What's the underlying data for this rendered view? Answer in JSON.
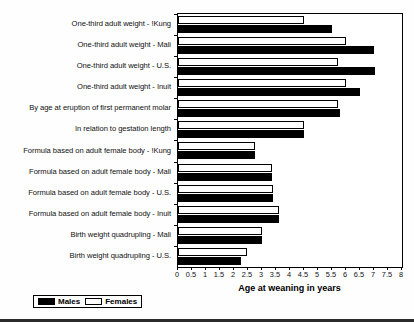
{
  "chart_data": {
    "type": "bar",
    "orientation": "horizontal",
    "title": "",
    "xlabel": "Age at weaning in years",
    "ylabel": "",
    "xlim": [
      0,
      8
    ],
    "xticks": [
      "0",
      "0.5",
      "1",
      "1.5",
      "2",
      "2.5",
      "3",
      "3.5",
      "4",
      "4.5",
      "5",
      "5.5",
      "6",
      "6.5",
      "7",
      "7.5",
      "8"
    ],
    "xtick_values": [
      0,
      0.5,
      1,
      1.5,
      2,
      2.5,
      3,
      3.5,
      4,
      4.5,
      5,
      5.5,
      6,
      6.5,
      7,
      7.5,
      8
    ],
    "grid": false,
    "legend_position": "bottom-left",
    "categories": [
      "One-third adult weight - !Kung",
      "One-third adult weight - Mali",
      "One-third adult weight - U.S.",
      "One-third adult weight - Inuit",
      "By age at eruption of first permanent molar",
      "In relation to gestation length",
      "Formula based on adult female body - !Kung",
      "Formula based on adult female body - Mali",
      "Formula based on adult female body - U.S.",
      "Formula based on adult female body - Inuit",
      "Birth weight quadrupling - Mali",
      "Birth weight quadrupling - U.S."
    ],
    "series": [
      {
        "name": "Females",
        "color": "#ffffff",
        "values": [
          4.5,
          6.0,
          5.7,
          6.0,
          5.7,
          4.5,
          2.75,
          3.35,
          3.4,
          3.6,
          3.0,
          2.45
        ]
      },
      {
        "name": "Males",
        "color": "#000000",
        "values": [
          5.5,
          7.0,
          7.05,
          6.5,
          5.8,
          4.5,
          2.75,
          3.35,
          3.4,
          3.6,
          3.0,
          2.25
        ]
      }
    ]
  },
  "legend": {
    "items": [
      {
        "label": "Males",
        "swatch": "male"
      },
      {
        "label": "Females",
        "swatch": "female"
      }
    ]
  }
}
